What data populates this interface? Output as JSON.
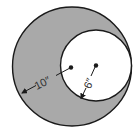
{
  "diagram": {
    "type": "concentric-offset-circles",
    "shaded_region": "area between outer and inner circle",
    "colors": {
      "shade": "#a9a9a9",
      "stroke": "#1a1a1a",
      "background": "#ffffff",
      "inner_fill": "#ffffff"
    },
    "outer_circle": {
      "radius_label": "10″",
      "radius_value": 10,
      "unit": "inches"
    },
    "inner_circle": {
      "radius_label": "6″",
      "radius_value": 6,
      "unit": "inches",
      "tangent_to_outer": "right side"
    }
  }
}
